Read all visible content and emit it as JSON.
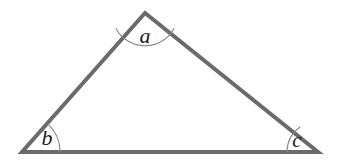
{
  "figure": {
    "name": "triangle-interior-angles",
    "background_color": "#ffffff",
    "stroke_color": "#6b6b6b",
    "arc_color": "#8a8a8a",
    "label_color": "#1a1a1a",
    "stroke_width": 4,
    "arc_width": 1.2,
    "width": 337,
    "height": 162
  },
  "triangle": {
    "vertices": [
      {
        "id": "apex",
        "label_ref": "a",
        "x": 145,
        "y": 13
      },
      {
        "id": "bottom-left",
        "label_ref": "b",
        "x": 22,
        "y": 152
      },
      {
        "id": "bottom-right",
        "label_ref": "c",
        "x": 318,
        "y": 152
      }
    ],
    "sides": [
      {
        "id": "left-side",
        "from": "bottom-left",
        "to": "apex"
      },
      {
        "id": "right-side",
        "from": "apex",
        "to": "bottom-right"
      },
      {
        "id": "base",
        "from": "bottom-left",
        "to": "bottom-right"
      }
    ],
    "path": "M 145 13 L 22 152 L 318 152 Z"
  },
  "angles": [
    {
      "id": "angle-a",
      "label": "a",
      "vertex": "apex",
      "arc_radius": 33,
      "arc_path": "M 115.8 28.2 A 33 33 0 0 0 174.2 28.2",
      "label_x": 145,
      "label_y": 43,
      "label_size": 22
    },
    {
      "id": "angle-b",
      "label": "b",
      "vertex": "bottom-left",
      "arc_radius": 38,
      "arc_path": "M 60 152 A 38 38 0 0 0 47.6 123.6",
      "label_x": 47,
      "label_y": 145,
      "label_size": 22
    },
    {
      "id": "angle-c",
      "label": "c",
      "vertex": "bottom-right",
      "arc_radius": 31,
      "arc_path": "M 287 152 A 31 31 0 0 1 300.1 126.9",
      "label_x": 297,
      "label_y": 147,
      "label_size": 21
    }
  ]
}
